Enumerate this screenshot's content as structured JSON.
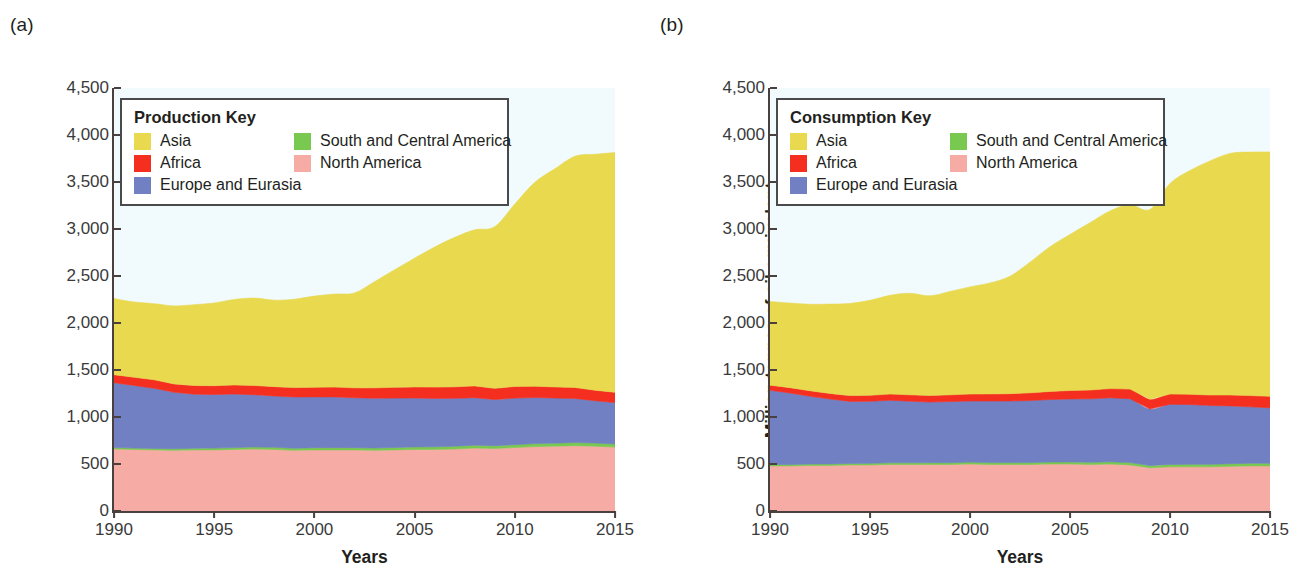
{
  "figure": {
    "panels": [
      {
        "tag": "(a)",
        "legend_title": "Production Key",
        "y_axis_label": "Million tonnes of oil equivalent",
        "x_axis_label": "Years"
      },
      {
        "tag": "(b)",
        "legend_title": "Consumption Key",
        "y_axis_label": "Million tonnes of oil equivalent",
        "x_axis_label": "Years"
      }
    ],
    "legend_entries": [
      {
        "label": "Asia",
        "color": "#e8d94f"
      },
      {
        "label": "South and Central America",
        "color": "#79c850"
      },
      {
        "label": "Africa",
        "color": "#f42f20"
      },
      {
        "label": "North America",
        "color": "#f6aca4"
      },
      {
        "label": "Europe and Eurasia",
        "color": "#7180c2"
      }
    ],
    "y_ticks": [
      "0",
      "500",
      "1,000",
      "1,500",
      "2,000",
      "2,500",
      "3,000",
      "3,500",
      "4,000",
      "4,500"
    ],
    "x_ticks": [
      "1990",
      "1995",
      "2000",
      "2005",
      "2010",
      "2015"
    ]
  },
  "chart_data": [
    {
      "type": "area",
      "id": "production",
      "title": "(a) Production",
      "legend_title": "Production Key",
      "xlabel": "Years",
      "ylabel": "Million tonnes of oil equivalent",
      "xlim": [
        1990,
        2015
      ],
      "ylim": [
        0,
        4500
      ],
      "ytick_step": 500,
      "xtick_step": 5,
      "grid": false,
      "stacked": true,
      "legend_position": "inside-top-left",
      "x": [
        1990,
        1991,
        1992,
        1993,
        1994,
        1995,
        1996,
        1997,
        1998,
        1999,
        2000,
        2001,
        2002,
        2003,
        2004,
        2005,
        2006,
        2007,
        2008,
        2009,
        2010,
        2011,
        2012,
        2013,
        2014,
        2015
      ],
      "series": [
        {
          "name": "North America",
          "color": "#f6aca4",
          "values": [
            660,
            655,
            650,
            645,
            650,
            650,
            655,
            660,
            655,
            645,
            650,
            650,
            650,
            645,
            650,
            655,
            655,
            660,
            670,
            665,
            675,
            685,
            690,
            695,
            690,
            680
          ]
        },
        {
          "name": "South and Central America",
          "color": "#79c850",
          "values": [
            15,
            15,
            16,
            17,
            18,
            19,
            20,
            22,
            23,
            23,
            24,
            24,
            24,
            25,
            26,
            27,
            28,
            29,
            30,
            30,
            31,
            32,
            32,
            33,
            33,
            33
          ]
        },
        {
          "name": "Europe and Eurasia",
          "color": "#7180c2",
          "values": [
            690,
            665,
            640,
            600,
            575,
            570,
            570,
            555,
            545,
            545,
            540,
            540,
            530,
            530,
            525,
            520,
            515,
            510,
            505,
            490,
            495,
            490,
            480,
            470,
            450,
            440
          ]
        },
        {
          "name": "Africa",
          "color": "#f42f20",
          "values": [
            85,
            88,
            90,
            90,
            92,
            94,
            96,
            98,
            100,
            100,
            102,
            104,
            106,
            110,
            115,
            118,
            120,
            122,
            126,
            120,
            124,
            120,
            118,
            116,
            112,
            110
          ]
        },
        {
          "name": "Asia",
          "color": "#e8d94f",
          "values": [
            810,
            800,
            810,
            830,
            860,
            880,
            910,
            930,
            920,
            940,
            970,
            990,
            1010,
            1130,
            1250,
            1370,
            1490,
            1590,
            1660,
            1720,
            1940,
            2170,
            2320,
            2460,
            2510,
            2550
          ]
        }
      ],
      "totals": [
        2260,
        2223,
        2206,
        2182,
        2195,
        2213,
        2251,
        2265,
        2243,
        2253,
        2286,
        2308,
        2320,
        2440,
        2566,
        2690,
        2808,
        2911,
        2991,
        3025,
        3265,
        3497,
        3640,
        3774,
        3795,
        3813
      ]
    },
    {
      "type": "area",
      "id": "consumption",
      "title": "(b) Consumption",
      "legend_title": "Consumption Key",
      "xlabel": "Years",
      "ylabel": "Million tonnes of oil equivalent",
      "xlim": [
        1990,
        2015
      ],
      "ylim": [
        0,
        4500
      ],
      "ytick_step": 500,
      "xtick_step": 5,
      "grid": false,
      "stacked": true,
      "legend_position": "inside-top-left",
      "x": [
        1990,
        1991,
        1992,
        1993,
        1994,
        1995,
        1996,
        1997,
        1998,
        1999,
        2000,
        2001,
        2002,
        2003,
        2004,
        2005,
        2006,
        2007,
        2008,
        2009,
        2010,
        2011,
        2012,
        2013,
        2014,
        2015
      ],
      "series": [
        {
          "name": "North America",
          "color": "#f6aca4",
          "values": [
            480,
            480,
            485,
            485,
            490,
            490,
            495,
            495,
            495,
            495,
            500,
            495,
            495,
            495,
            500,
            500,
            495,
            500,
            490,
            460,
            470,
            470,
            470,
            475,
            480,
            480
          ]
        },
        {
          "name": "South and Central America",
          "color": "#79c850",
          "values": [
            14,
            15,
            15,
            16,
            16,
            17,
            18,
            18,
            19,
            19,
            20,
            20,
            20,
            20,
            21,
            22,
            23,
            24,
            25,
            24,
            26,
            27,
            27,
            28,
            28,
            28
          ]
        },
        {
          "name": "Europe and Eurasia",
          "color": "#7180c2",
          "values": [
            790,
            760,
            720,
            690,
            660,
            660,
            665,
            655,
            645,
            650,
            650,
            655,
            655,
            660,
            665,
            670,
            675,
            680,
            680,
            600,
            640,
            635,
            625,
            615,
            600,
            590
          ]
        },
        {
          "name": "Africa",
          "color": "#f42f20",
          "values": [
            55,
            57,
            59,
            60,
            62,
            64,
            66,
            68,
            70,
            72,
            74,
            76,
            78,
            82,
            86,
            90,
            94,
            98,
            102,
            104,
            108,
            110,
            112,
            116,
            120,
            122
          ]
        },
        {
          "name": "Asia",
          "color": "#e8d94f",
          "values": [
            890,
            900,
            920,
            950,
            980,
            1010,
            1050,
            1080,
            1060,
            1100,
            1140,
            1180,
            1250,
            1390,
            1540,
            1660,
            1780,
            1890,
            1960,
            2020,
            2240,
            2380,
            2490,
            2570,
            2590,
            2600
          ]
        }
      ],
      "totals": [
        2229,
        2212,
        2199,
        2201,
        2208,
        2241,
        2294,
        2316,
        2289,
        2336,
        2384,
        2426,
        2498,
        2647,
        2812,
        2942,
        3067,
        3192,
        3257,
        3208,
        3484,
        3622,
        3724,
        3804,
        3818,
        3820
      ]
    }
  ]
}
